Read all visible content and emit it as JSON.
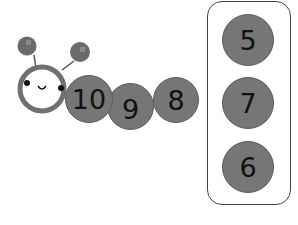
{
  "caterpillar": {
    "segments": [
      {
        "label": "10"
      },
      {
        "label": "9"
      },
      {
        "label": "8"
      }
    ]
  },
  "answer_box": {
    "options": [
      {
        "label": "5"
      },
      {
        "label": "7"
      },
      {
        "label": "6"
      }
    ]
  },
  "colors": {
    "segment_fill": "#767676",
    "head_ring": "#707070",
    "outline": "#444444"
  }
}
